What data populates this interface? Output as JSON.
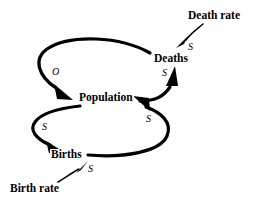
{
  "diagram": {
    "type": "causal-loop-diagram",
    "background_color": "#ffffff",
    "stroke_color": "#000000",
    "nodes": [
      {
        "id": "population",
        "label": "Population",
        "x": 107,
        "y": 98
      },
      {
        "id": "deaths",
        "label": "Deaths",
        "x": 172,
        "y": 59
      },
      {
        "id": "births",
        "label": "Births",
        "x": 67,
        "y": 155
      },
      {
        "id": "death_rate",
        "label": "Death rate",
        "x": 217,
        "y": 16
      },
      {
        "id": "birth_rate",
        "label": "Birth rate",
        "x": 37,
        "y": 189
      }
    ],
    "links": [
      {
        "id": "deaths-to-population",
        "from": "deaths",
        "to": "population",
        "polarity": "O"
      },
      {
        "id": "population-to-deaths",
        "from": "population",
        "to": "deaths",
        "polarity": "S"
      },
      {
        "id": "death-rate-to-deaths",
        "from": "death_rate",
        "to": "deaths",
        "polarity": "S"
      },
      {
        "id": "population-to-births",
        "from": "population",
        "to": "births",
        "polarity": "S"
      },
      {
        "id": "births-to-population",
        "from": "births",
        "to": "population",
        "polarity": "S"
      },
      {
        "id": "birth-rate-to-births",
        "from": "birth_rate",
        "to": "births",
        "polarity": "S"
      }
    ],
    "polarity_labels": [
      {
        "id": "polarity-deaths-population",
        "text": "O",
        "x": 52,
        "y": 67
      },
      {
        "id": "polarity-population-deaths",
        "text": "S",
        "x": 162,
        "y": 68
      },
      {
        "id": "polarity-death-rate-deaths",
        "text": "S",
        "x": 188,
        "y": 42
      },
      {
        "id": "polarity-population-births",
        "text": "S",
        "x": 42,
        "y": 122
      },
      {
        "id": "polarity-births-population",
        "text": "S",
        "x": 146,
        "y": 114
      },
      {
        "id": "polarity-birth-rate-births",
        "text": "S",
        "x": 88,
        "y": 164
      }
    ]
  }
}
